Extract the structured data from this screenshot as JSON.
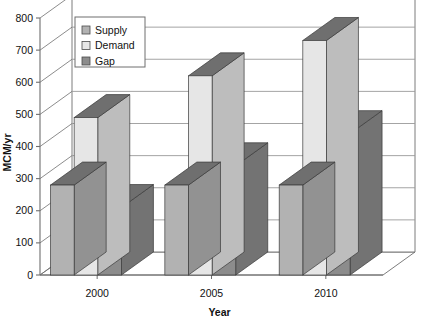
{
  "chart_data": {
    "type": "bar",
    "title": "",
    "subtitle": "",
    "xlabel": "Year",
    "ylabel": "MCM/yr",
    "categories": [
      "2000",
      "2005",
      "2010"
    ],
    "series": [
      {
        "name": "Supply",
        "values": [
          280,
          280,
          280
        ],
        "color": "#b2b2b2"
      },
      {
        "name": "Demand",
        "values": [
          490,
          620,
          730
        ],
        "color": "#e6e6e6"
      },
      {
        "name": "Gap",
        "values": [
          210,
          340,
          440
        ],
        "color": "#8c8c8c"
      }
    ],
    "ylim": [
      0,
      800
    ],
    "yticks": [
      0,
      100,
      200,
      300,
      400,
      500,
      600,
      700,
      800
    ],
    "ytick_labels": [
      "0",
      "100",
      "200",
      "300",
      "400",
      "500",
      "600",
      "700",
      "800"
    ],
    "grid": true,
    "grid_axis": "y",
    "legend_position": "top-left-inside",
    "style": "3d-column",
    "plot_background": "#ffffff",
    "grid_color": "#9a9a9a",
    "axis_color": "#6e6e6e",
    "frame_color": "#6e6e6e",
    "bar_edge_color": "#3a3a3a",
    "legend_border_color": "#6e6e6e",
    "legend_background": "#ffffff",
    "top_face_shade": "#6f6f6f",
    "side_face_shade_factor": 0.82
  },
  "axes": {
    "y_axis_title": "MCM/yr",
    "x_axis_title": "Year"
  },
  "legend": {
    "items": [
      {
        "label": "Supply",
        "swatch": "#b2b2b2"
      },
      {
        "label": "Demand",
        "swatch": "#e6e6e6"
      },
      {
        "label": "Gap",
        "swatch": "#8c8c8c"
      }
    ]
  }
}
